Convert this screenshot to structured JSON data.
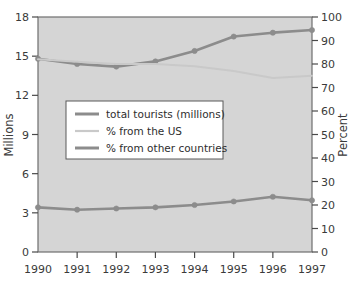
{
  "chart_data": {
    "type": "line",
    "title": "",
    "xlabel": "",
    "ylabel": "Millions",
    "y2label": "Percent",
    "categories": [
      "1990",
      "1991",
      "1992",
      "1993",
      "1994",
      "1995",
      "1996",
      "1997"
    ],
    "x": [
      1990,
      1991,
      1992,
      1993,
      1994,
      1995,
      1996,
      1997
    ],
    "ylim": [
      0,
      18
    ],
    "yticks": [
      0,
      3,
      6,
      9,
      12,
      15,
      18
    ],
    "y2lim": [
      0,
      100
    ],
    "y2ticks": [
      0,
      10,
      20,
      30,
      40,
      50,
      60,
      70,
      80,
      90,
      100
    ],
    "grid": false,
    "legend_position": "center-left",
    "plot_background": "#d5d5d5",
    "series": [
      {
        "name": "total tourists (millions)",
        "axis": "left",
        "color": "#8c8c8c",
        "values": [
          14.8,
          14.4,
          14.2,
          14.6,
          15.4,
          16.5,
          16.8,
          17.0
        ]
      },
      {
        "name": "% from the US",
        "axis": "right",
        "color": "#c9c9c9",
        "values": [
          82,
          81,
          80,
          80,
          79,
          77,
          74,
          75
        ]
      },
      {
        "name": "% from other countries",
        "axis": "right",
        "color": "#8c8c8c",
        "values": [
          19,
          18,
          18.5,
          19,
          20,
          21.5,
          23.5,
          22
        ]
      }
    ]
  },
  "axes": {
    "left": {
      "title": "Millions",
      "ticks": [
        "18",
        "15",
        "12",
        "9",
        "6",
        "3",
        "0"
      ]
    },
    "right": {
      "title": "Percent",
      "ticks": [
        "100",
        "90",
        "80",
        "70",
        "60",
        "50",
        "40",
        "30",
        "20",
        "10",
        "0"
      ]
    },
    "bottom": {
      "ticks": [
        "1990",
        "1991",
        "1992",
        "1993",
        "1994",
        "1995",
        "1996",
        "1997"
      ]
    }
  },
  "legend": {
    "items": [
      {
        "label": "total tourists (millions)",
        "color": "#8c8c8c"
      },
      {
        "label": "% from the US",
        "color": "#c9c9c9"
      },
      {
        "label": "% from other countries",
        "color": "#8c8c8c"
      }
    ]
  }
}
